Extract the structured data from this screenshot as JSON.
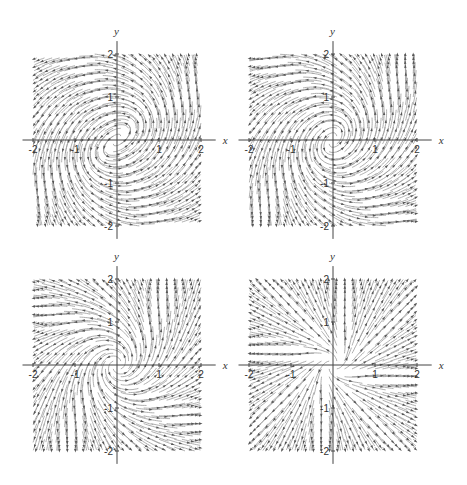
{
  "figure": {
    "width": 467,
    "height": 485,
    "background": "#ffffff"
  },
  "style": {
    "stream_color": "#9a9a9a",
    "arrow_color": "#555555",
    "axis_color": "#444444"
  },
  "chart_data": [
    {
      "type": "streamplot",
      "title": "",
      "xlabel": "x",
      "ylabel": "y",
      "xlim": [
        -2,
        2
      ],
      "ylim": [
        -2,
        2
      ],
      "xticks": [
        -2,
        -1,
        1,
        2
      ],
      "yticks": [
        -2,
        -1,
        1,
        2
      ],
      "xtick_labels": [
        "-2",
        "-1",
        "1",
        "2"
      ],
      "ytick_labels": [
        "-2",
        "-1",
        "1",
        "2"
      ],
      "grid": false,
      "description": "Two counter-rotating-symmetric spiral foci near (0.5,0.4) and (-0.5,-0.4); outward saddle-like flow elsewhere",
      "field": {
        "radial": 0.35,
        "vortices": [
          {
            "cx": 0.5,
            "cy": 0.4,
            "s": 1.0
          },
          {
            "cx": -0.5,
            "cy": -0.4,
            "s": 1.0
          }
        ]
      },
      "layout": {
        "left": 0,
        "top": 0,
        "x0": 117,
        "y0": 140,
        "px_per_unit_x": 42,
        "px_per_unit_y": 43
      }
    },
    {
      "type": "streamplot",
      "title": "",
      "xlabel": "x",
      "ylabel": "y",
      "xlim": [
        -2,
        2
      ],
      "ylim": [
        -2,
        2
      ],
      "xticks": [
        -2,
        -1,
        1,
        2
      ],
      "yticks": [
        -2,
        -1,
        1,
        2
      ],
      "xtick_labels": [
        "-2",
        "-1",
        "1",
        "2"
      ],
      "ytick_labels": [
        "-2",
        "-1",
        "1",
        "2"
      ],
      "grid": false,
      "description": "Two tighter spiral foci near (0.25,0.3) and (-0.25,-0.3); saddle-type separatrices along y≈1 and y≈-1",
      "field": {
        "radial": 0.45,
        "vortices": [
          {
            "cx": 0.25,
            "cy": 0.3,
            "s": 0.8
          },
          {
            "cx": -0.25,
            "cy": -0.3,
            "s": 0.8
          }
        ]
      },
      "layout": {
        "left": 233,
        "top": 0,
        "x0": 100,
        "y0": 140,
        "px_per_unit_x": 42,
        "px_per_unit_y": 43
      }
    },
    {
      "type": "streamplot",
      "title": "",
      "xlabel": "x",
      "ylabel": "y",
      "xlim": [
        -2,
        2
      ],
      "ylim": [
        -2,
        2
      ],
      "xticks": [
        -2,
        -1,
        1,
        2
      ],
      "yticks": [
        -2,
        -1,
        1,
        2
      ],
      "xtick_labels": [
        "-2",
        "-1",
        "1",
        "2"
      ],
      "ytick_labels": [
        "-2",
        "-1",
        "1",
        "2"
      ],
      "grid": false,
      "description": "Center (closed orbits) at the origin; outward flow away from origin",
      "field": {
        "radial": 0.5,
        "vortices": [
          {
            "cx": 0.0,
            "cy": 0.0,
            "s": 0.9
          }
        ],
        "core": 0.55
      },
      "layout": {
        "left": 0,
        "top": 242,
        "x0": 117,
        "y0": 123,
        "px_per_unit_x": 42,
        "px_per_unit_y": 43
      }
    },
    {
      "type": "streamplot",
      "title": "",
      "xlabel": "x",
      "ylabel": "y",
      "xlim": [
        -2,
        2
      ],
      "ylim": [
        -2,
        2
      ],
      "xticks": [
        -2,
        -1,
        1,
        2
      ],
      "yticks": [
        -2,
        -1,
        1,
        2
      ],
      "xtick_labels": [
        "-2",
        "-1",
        "1",
        "2"
      ],
      "ytick_labels": [
        "-2",
        "-1",
        "1",
        "2"
      ],
      "grid": false,
      "description": "Unstable node-like flow with slight twist at the origin; mostly radial outward",
      "field": {
        "radial": 1.0,
        "vortices": [
          {
            "cx": 0.0,
            "cy": 0.0,
            "s": 0.35
          }
        ],
        "core": 0.15
      },
      "layout": {
        "left": 233,
        "top": 242,
        "x0": 100,
        "y0": 123,
        "px_per_unit_x": 42,
        "px_per_unit_y": 43
      }
    }
  ]
}
